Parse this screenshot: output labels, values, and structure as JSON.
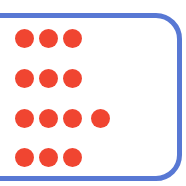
{
  "canvas": {
    "width": 186,
    "height": 186,
    "background_color": "#ffffff"
  },
  "frame": {
    "name": "rounded-rectangle-border",
    "color": "#5878d4",
    "stroke_width": 5,
    "corner_radius": 26,
    "top_edge_y": 15,
    "bottom_edge_y": 179,
    "description": "blue rounded frame, left side cropped out of view"
  },
  "dot_grid": {
    "dot_color": "#f04531",
    "dot_diameter": 19,
    "column_x_centers": [
      24,
      48,
      72,
      100
    ],
    "row_y_centers": [
      38,
      78,
      118,
      157
    ],
    "rows": [
      {
        "label": "row-1",
        "count": 3,
        "y": 38,
        "dots_x": [
          24,
          48,
          72
        ]
      },
      {
        "label": "row-2",
        "count": 3,
        "y": 78,
        "dots_x": [
          24,
          48,
          72
        ]
      },
      {
        "label": "row-3",
        "count": 4,
        "y": 118,
        "dots_x": [
          24,
          48,
          72,
          100
        ]
      },
      {
        "label": "row-4",
        "count": 3,
        "y": 157,
        "dots_x": [
          24,
          48,
          72
        ]
      }
    ],
    "total_dots": 13
  }
}
